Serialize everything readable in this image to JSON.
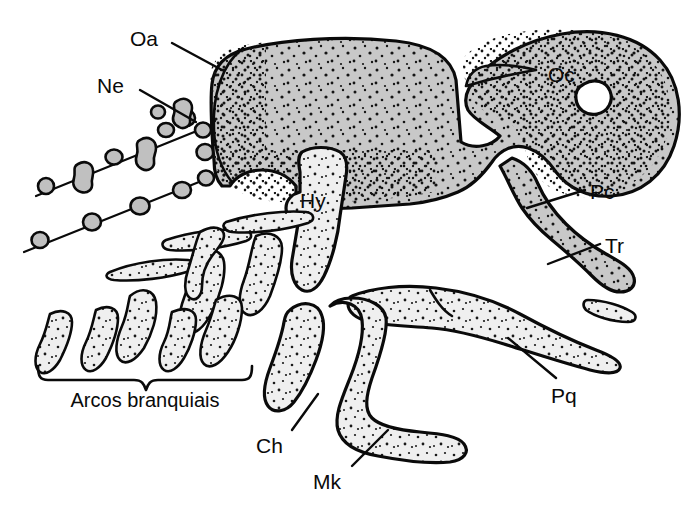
{
  "figure": {
    "language": "pt-BR",
    "background_color": "#ffffff",
    "ink_color": "#0a0a0a",
    "fill_dark_gray": "#c8c8c8",
    "fill_light_gray": "#efefef",
    "stipple_color": "#111111"
  },
  "labels": {
    "oa": "Oa",
    "ne": "Ne",
    "oc": "Oc",
    "pc": "Pc",
    "tr": "Tr",
    "pq": "Pq",
    "hy": "Hy",
    "ch": "Ch",
    "mk": "Mk",
    "arcos": "Arcos branquiais"
  },
  "structures": [
    {
      "key": "oa",
      "label": "Oa",
      "name": "orbital-antorbital-process",
      "fill": "#c8c8c8"
    },
    {
      "key": "ne",
      "label": "Ne",
      "name": "neural-arch-elements",
      "fill": "#c8c8c8"
    },
    {
      "key": "oc",
      "label": "Oc",
      "name": "occipital-region",
      "fill": "#c8c8c8"
    },
    {
      "key": "pc",
      "label": "Pc",
      "name": "pharyngobranchial-cartilage",
      "fill": "#c8c8c8"
    },
    {
      "key": "tr",
      "label": "Tr",
      "name": "tract-epibranchial",
      "fill": "#c8c8c8"
    },
    {
      "key": "pq",
      "label": "Pq",
      "name": "palatoquadrate",
      "fill": "#efefef"
    },
    {
      "key": "hy",
      "label": "Hy",
      "name": "hyomandibula",
      "fill": "#efefef"
    },
    {
      "key": "ch",
      "label": "Ch",
      "name": "ceratohyal",
      "fill": "#efefef"
    },
    {
      "key": "mk",
      "label": "Mk",
      "name": "meckels-cartilage",
      "fill": "#efefef"
    }
  ],
  "caption": {
    "bracket_label": "Arcos branquiais"
  }
}
